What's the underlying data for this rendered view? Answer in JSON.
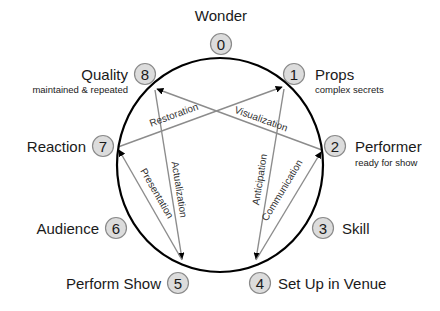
{
  "diagram": {
    "ring": {
      "cx": 220,
      "cy": 165,
      "rx": 103,
      "ry": 107
    },
    "colors": {
      "bubble_fill": "#dcdcdc",
      "bubble_stroke": "#8a8a8a",
      "arrow": "#8c8c8c",
      "ring": "#000000",
      "text": "#1a1a1a"
    },
    "stages": [
      {
        "num": "0",
        "name": "Wonder",
        "sub": "",
        "bx": 221,
        "by": 44,
        "nx": 221,
        "ny": 21,
        "anchor": "middle",
        "sx": 0,
        "sy": 0
      },
      {
        "num": "1",
        "name": "Props",
        "sub": "complex secrets",
        "bx": 294,
        "by": 74,
        "nx": 315,
        "ny": 80,
        "anchor": "start",
        "sx": 315,
        "sy": 93
      },
      {
        "num": "2",
        "name": "Performer",
        "sub": "ready for show",
        "bx": 335,
        "by": 146,
        "nx": 355,
        "ny": 152,
        "anchor": "start",
        "sx": 355,
        "sy": 166
      },
      {
        "num": "3",
        "name": "Skill",
        "sub": "",
        "bx": 323,
        "by": 228,
        "nx": 342,
        "ny": 234,
        "anchor": "start",
        "sx": 0,
        "sy": 0
      },
      {
        "num": "4",
        "name": "Set Up in Venue",
        "sub": "",
        "bx": 260,
        "by": 283,
        "nx": 278,
        "ny": 289,
        "anchor": "start",
        "sx": 0,
        "sy": 0
      },
      {
        "num": "5",
        "name": "Perform Show",
        "sub": "",
        "bx": 178,
        "by": 283,
        "nx": 161,
        "ny": 289,
        "anchor": "end",
        "sx": 0,
        "sy": 0
      },
      {
        "num": "6",
        "name": "Audience",
        "sub": "",
        "bx": 116,
        "by": 228,
        "nx": 99,
        "ny": 234,
        "anchor": "end",
        "sx": 0,
        "sy": 0
      },
      {
        "num": "7",
        "name": "Reaction",
        "sub": "",
        "bx": 103,
        "by": 146,
        "nx": 86,
        "ny": 152,
        "anchor": "end",
        "sx": 0,
        "sy": 0
      },
      {
        "num": "8",
        "name": "Quality",
        "sub": "maintained & repeated",
        "bx": 145,
        "by": 74,
        "nx": 128,
        "ny": 80,
        "anchor": "end",
        "sx": 128,
        "sy": 93
      }
    ],
    "arrows": [
      {
        "label": "Restoration",
        "from": "7",
        "to": "1",
        "x1": 118,
        "y1": 147,
        "x2": 282,
        "y2": 87,
        "lx": 175,
        "ly": 118,
        "rot": -20
      },
      {
        "label": "Visualization",
        "from": "2",
        "to": "8",
        "x1": 322,
        "y1": 150,
        "x2": 157,
        "y2": 89,
        "lx": 260,
        "ly": 122,
        "rot": 20
      },
      {
        "label": "Actualization",
        "from": "8",
        "to": "5",
        "x1": 155,
        "y1": 90,
        "x2": 182,
        "y2": 259,
        "lx": 176,
        "ly": 190,
        "rot": 81
      },
      {
        "label": "Presentation",
        "from": "5",
        "to": "7",
        "x1": 182,
        "y1": 260,
        "x2": 119,
        "y2": 150,
        "lx": 154,
        "ly": 195,
        "rot": 60
      },
      {
        "label": "Anticipation",
        "from": "1",
        "to": "4",
        "x1": 284,
        "y1": 89,
        "x2": 256,
        "y2": 259,
        "lx": 263,
        "ly": 180,
        "rot": -81
      },
      {
        "label": "Communication",
        "from": "4",
        "to": "2",
        "x1": 256,
        "y1": 260,
        "x2": 321,
        "y2": 152,
        "lx": 285,
        "ly": 192,
        "rot": -59
      }
    ]
  }
}
